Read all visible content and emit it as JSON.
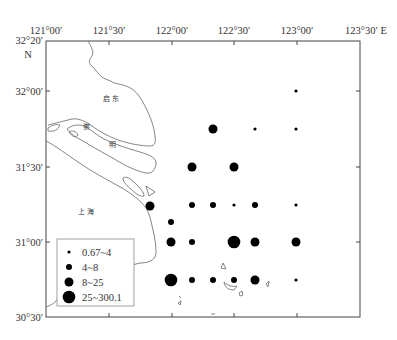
{
  "map": {
    "frame": {
      "x0": 46,
      "y0": 41,
      "x1": 360,
      "y1": 317
    },
    "top_labels": [
      {
        "text": "121°00′",
        "x": 46
      },
      {
        "text": "121°30′",
        "x": 109
      },
      {
        "text": "122°00′",
        "x": 172
      },
      {
        "text": "122°30′",
        "x": 234
      },
      {
        "text": "123°00′",
        "x": 297
      },
      {
        "text": "123°30′ E",
        "x": 360
      }
    ],
    "left_labels": [
      {
        "text": "32°20′",
        "y": 41
      },
      {
        "text": "N",
        "y": 55
      },
      {
        "text": "32°00′",
        "y": 91
      },
      {
        "text": "31°30′",
        "y": 167
      },
      {
        "text": "31°00′",
        "y": 242
      },
      {
        "text": "30°30′",
        "y": 317
      }
    ],
    "place_labels": [
      {
        "text": "启 东",
        "x": 111,
        "y": 101
      },
      {
        "text": "崇",
        "x": 86,
        "y": 129
      },
      {
        "text": "明",
        "x": 112,
        "y": 147
      },
      {
        "text": "上 海",
        "x": 86,
        "y": 212
      }
    ]
  },
  "legend": {
    "items": [
      {
        "label": "0.67~4",
        "r": 1.6
      },
      {
        "label": "4~8",
        "r": 3.0
      },
      {
        "label": "8~25",
        "r": 4.5
      },
      {
        "label": "25~300.1",
        "r": 6.3
      }
    ]
  },
  "chart_data": {
    "type": "scatter",
    "title": "",
    "xlabel": "Longitude (E)",
    "ylabel": "Latitude (N)",
    "xlim": [
      "121°00′",
      "123°30′"
    ],
    "ylim": [
      "30°30′",
      "32°20′"
    ],
    "legend_classes": [
      "0.67~4",
      "4~8",
      "8~25",
      "25~300.1"
    ],
    "points": [
      {
        "x": 296,
        "y": 91,
        "cls": 0
      },
      {
        "x": 213,
        "y": 129,
        "cls": 2
      },
      {
        "x": 255,
        "y": 129,
        "cls": 0
      },
      {
        "x": 296,
        "y": 129,
        "cls": 0
      },
      {
        "x": 192,
        "y": 167,
        "cls": 2
      },
      {
        "x": 234,
        "y": 167,
        "cls": 2
      },
      {
        "x": 150,
        "y": 206,
        "cls": 2
      },
      {
        "x": 192,
        "y": 205,
        "cls": 1
      },
      {
        "x": 213,
        "y": 205,
        "cls": 1
      },
      {
        "x": 234,
        "y": 205,
        "cls": 0
      },
      {
        "x": 255,
        "y": 205,
        "cls": 1
      },
      {
        "x": 296,
        "y": 205,
        "cls": 0
      },
      {
        "x": 171,
        "y": 222,
        "cls": 1
      },
      {
        "x": 171,
        "y": 242,
        "cls": 2
      },
      {
        "x": 192,
        "y": 242,
        "cls": 1
      },
      {
        "x": 234,
        "y": 242,
        "cls": 3
      },
      {
        "x": 255,
        "y": 242,
        "cls": 2
      },
      {
        "x": 296,
        "y": 242,
        "cls": 2
      },
      {
        "x": 171,
        "y": 280,
        "cls": 3
      },
      {
        "x": 192,
        "y": 280,
        "cls": 1
      },
      {
        "x": 213,
        "y": 280,
        "cls": 1
      },
      {
        "x": 234,
        "y": 280,
        "cls": 1
      },
      {
        "x": 255,
        "y": 280,
        "cls": 2
      },
      {
        "x": 296,
        "y": 280,
        "cls": 0
      }
    ]
  }
}
